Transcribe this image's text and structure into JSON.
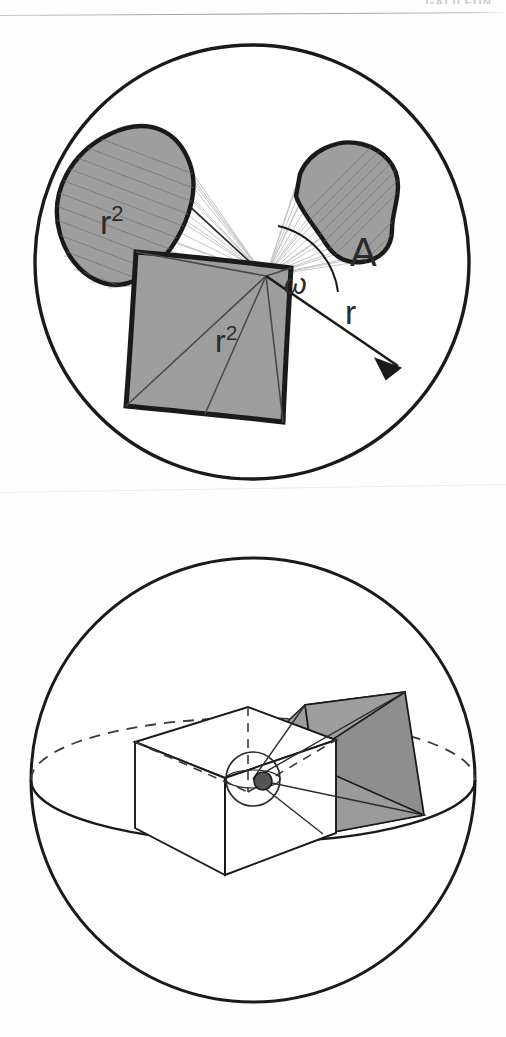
{
  "page": {
    "running_head": "GALILEON",
    "background_color": "#fefefe",
    "rule_color": "#9b9b9b"
  },
  "palette": {
    "ink": "#1a1a1a",
    "gray_fill": "#9e9e9e",
    "gray_fill_dark": "#8e8e8e",
    "hatch": "#6f6f6f",
    "ray": "#b8b8b8",
    "white": "#ffffff"
  },
  "figures": [
    {
      "id": "solid-angle-2d",
      "name": "solid-angle-projection-diagram",
      "description": "Circle containing an apex point from which rays fan out onto three patches: an elliptical disc, an irregular blob, and a square.",
      "elements": {
        "outer_circle": "sphere-outline",
        "apex": "vertex-point",
        "angle_arc": "omega-arc",
        "arrow": "radius-arrow"
      },
      "labels": [
        {
          "key": "cone_disc",
          "name": "label-r-squared-disc",
          "base": "r",
          "sup": "2",
          "x": 108,
          "y": 192
        },
        {
          "key": "blob",
          "name": "label-A",
          "base": "A",
          "sup": "",
          "x": 363,
          "y": 215
        },
        {
          "key": "omega",
          "name": "label-omega",
          "base": "ω",
          "sup": "",
          "x": 295,
          "y": 253
        },
        {
          "key": "radius",
          "name": "label-r",
          "base": "r",
          "sup": "",
          "x": 350,
          "y": 320
        },
        {
          "key": "square",
          "name": "label-r-squared-square",
          "base": "r",
          "sup": "2",
          "x": 228,
          "y": 345
        }
      ]
    },
    {
      "id": "steradian-3d",
      "name": "unit-solid-angle-sphere-diagram",
      "description": "Sphere shown with equator ellipse, an open rectangular box whose apex sits at the sphere centre, and a shaded frustum projecting toward the sphere surface.",
      "elements": {
        "outer_circle": "sphere-outline",
        "equator": "equator-ellipse",
        "box": "unit-box",
        "frustum": "shaded-frustum",
        "center_sphere": "center-point-sphere",
        "center_dot": "center-point"
      },
      "labels": []
    }
  ]
}
